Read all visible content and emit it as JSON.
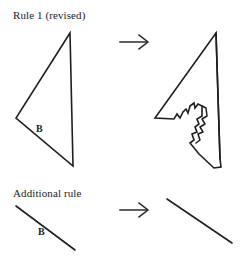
{
  "document": {
    "kind": "shape-grammar-rule-diagram",
    "background_color": "#ffffff",
    "ink_color": "#1f1f1f"
  },
  "rules": [
    {
      "id": "rule-1",
      "title": "Rule 1 (revised)",
      "arrow_glyph": "arrow-right-icon",
      "lhs": {
        "shape_name": "triangle",
        "edge_label": "B",
        "vertices": [
          [
            70,
            13
          ],
          [
            16,
            98
          ],
          [
            73,
            146
          ]
        ]
      },
      "rhs": {
        "shape_name": "triangle-with-jagged-notch",
        "outline": [
          [
            66,
            13
          ],
          [
            5,
            98
          ],
          [
            24,
            99
          ],
          [
            27,
            94
          ],
          [
            30,
            98
          ],
          [
            33,
            92
          ],
          [
            36,
            89
          ],
          [
            38,
            93
          ],
          [
            40,
            86
          ],
          [
            44,
            83
          ],
          [
            45,
            88
          ],
          [
            48,
            84
          ],
          [
            52,
            86
          ],
          [
            52,
            96
          ],
          [
            47,
            99
          ],
          [
            49,
            104
          ],
          [
            45,
            107
          ],
          [
            47,
            112
          ],
          [
            42,
            114
          ],
          [
            44,
            120
          ],
          [
            40,
            123
          ],
          [
            49,
            134
          ],
          [
            64,
            148
          ],
          [
            71,
            147
          ],
          [
            70,
            139
          ]
        ],
        "inner_detail": [
          [
            52,
            86
          ],
          [
            56,
            88
          ],
          [
            57,
            96
          ],
          [
            52,
            99
          ],
          [
            55,
            104
          ],
          [
            50,
            107
          ],
          [
            53,
            112
          ],
          [
            48,
            114
          ],
          [
            50,
            120
          ],
          [
            46,
            123
          ]
        ],
        "right_spine": [
          [
            66,
            13
          ],
          [
            70,
            139
          ]
        ]
      }
    },
    {
      "id": "rule-2",
      "title": "Additional rule",
      "arrow_glyph": "arrow-right-icon",
      "lhs": {
        "shape_name": "line-segment",
        "edge_label": "B",
        "endpoints": [
          [
            16,
            16
          ],
          [
            75,
            60
          ]
        ]
      },
      "rhs": {
        "shape_name": "line-segment",
        "edge_label": "",
        "endpoints": [
          [
            17,
            9
          ],
          [
            82,
            53
          ]
        ]
      }
    }
  ],
  "labels": {
    "rule1_title": "Rule 1 (revised)",
    "rule2_title": "Additional rule",
    "b_triangle": "B",
    "b_line": "B"
  }
}
